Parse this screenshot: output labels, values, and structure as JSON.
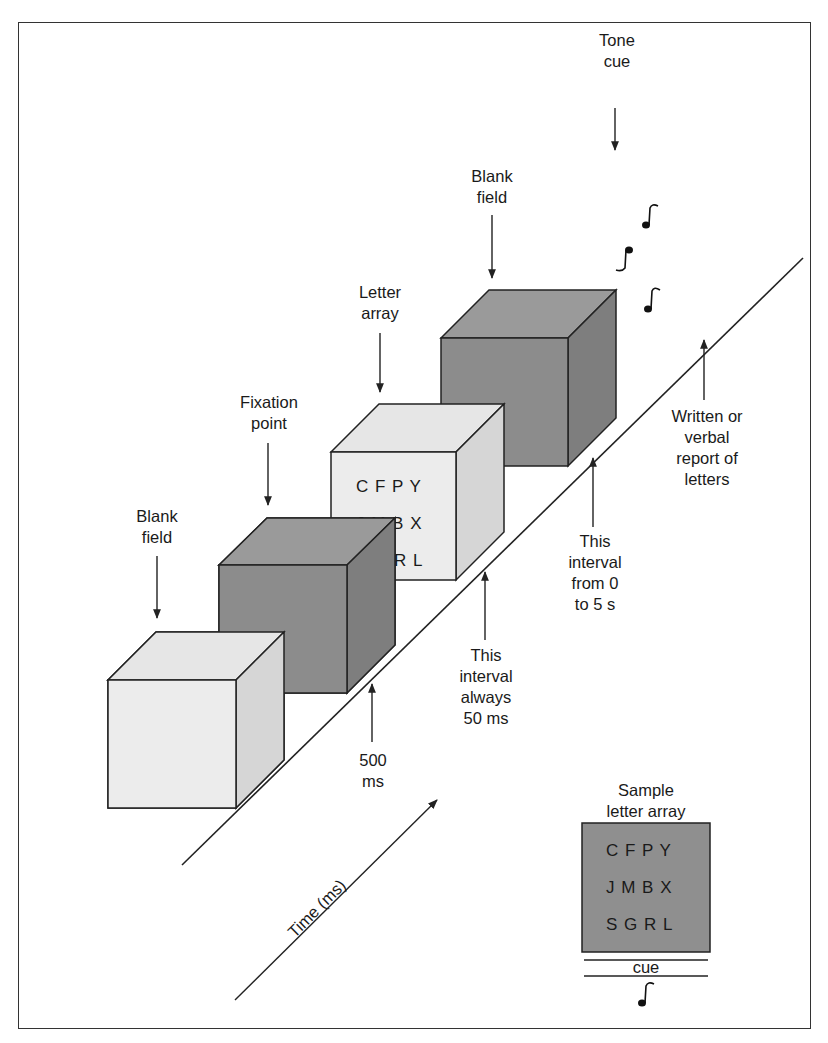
{
  "figure": {
    "labels": {
      "tone_cue": "Tone\ncue",
      "blank_field_1": "Blank\nfield",
      "fixation_point": "Fixation\npoint",
      "letter_array": "Letter\narray",
      "blank_field_2": "Blank\nfield",
      "interval_500": "500\nms",
      "interval_50": "This\ninterval\nalways\n50 ms",
      "interval_0_5": "This\ninterval\nfrom 0\nto 5 s",
      "report": "Written or\nverbal\nreport of\nletters",
      "time_axis": "Time (ms)",
      "sample_title": "Sample\nletter array",
      "cue": "cue"
    },
    "array_on_cube": [
      "C F P Y",
      "J M B X",
      "S G R L"
    ],
    "sample_array": [
      "C F P Y",
      "J M B X",
      "S G R L"
    ],
    "colors": {
      "light_face": "#e8e8e8",
      "light_side": "#d9d9d9",
      "dark_face": "#8c8c8c",
      "dark_side": "#7a7a7a",
      "line": "#222222"
    }
  }
}
